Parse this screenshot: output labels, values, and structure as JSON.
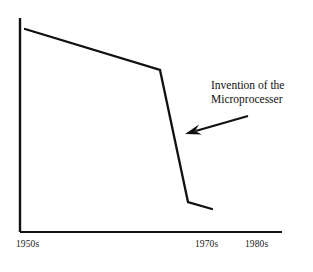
{
  "figure": {
    "background_color": "#ffffff",
    "ink_color": "#111111"
  },
  "annotation": {
    "line1": "Invention of the",
    "line2": "Microprocesser",
    "arrow": {
      "name": "annotation-arrow",
      "tail_x": 248,
      "tail_y": 116,
      "head_x": 185,
      "head_y": 134
    }
  },
  "axes": {
    "x_axis": {
      "x1": 20,
      "y1": 232,
      "x2": 282,
      "y2": 232
    },
    "y_axis": {
      "x1": 20,
      "y1": 18,
      "x2": 20,
      "y2": 232
    },
    "x_tick_labels": [
      {
        "text": "1950s",
        "x": 16,
        "y": 240
      },
      {
        "text": "1970s",
        "x": 195,
        "y": 240
      },
      {
        "text": "1980s",
        "x": 245,
        "y": 240
      }
    ]
  },
  "chart_data": {
    "type": "line",
    "title": "",
    "xlabel": "",
    "ylabel": "",
    "grid": false,
    "legend": null,
    "x_tick_labels": [
      "1950s",
      "1970s",
      "1980s"
    ],
    "x_tick_pixels": [
      33,
      210,
      260
    ],
    "annotations": [
      {
        "text": "Invention of the Microprocesser",
        "points_to_x_pixel": 185,
        "points_to_y_pixel": 134,
        "arrow": true
      }
    ],
    "series": [
      {
        "name": "trend",
        "points_pixels": [
          [
            25,
            29
          ],
          [
            160,
            70
          ],
          [
            188,
            202
          ],
          [
            212,
            209
          ]
        ],
        "description": "Steady gentle decline through the 1950s and 1960s, then a sharp collapse around 1970 coinciding with the invention of the microprocessor, flattening out afterwards.",
        "x": [
          "1950s",
          "late 1960s",
          "early 1970s",
          "mid 1970s"
        ],
        "values": [
          95,
          76,
          14,
          11
        ]
      }
    ],
    "ylim": [
      0,
      100
    ]
  }
}
